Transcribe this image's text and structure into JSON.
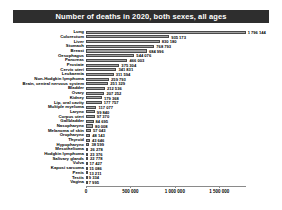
{
  "page": {
    "background": "#ffffff"
  },
  "header": {
    "title": "Number of deaths in 2020, both sexes, all ages",
    "bg_color": "#2e2e2e",
    "text_color": "#ffffff"
  },
  "chart_data": {
    "type": "bar",
    "orientation": "horizontal",
    "title": "Number of deaths in 2020, both sexes, all ages",
    "xlabel": "",
    "ylabel": "",
    "grid": false,
    "legend": "none",
    "xlim": [
      0,
      1800000
    ],
    "categories": [
      "Lung",
      "Colorectum",
      "Liver",
      "Stomach",
      "Breast",
      "Oesophagus",
      "Pancreas",
      "Prostate",
      "Cervix uteri",
      "Leukaemia",
      "Non-Hodgkin lymphoma",
      "Brain, central nervous system",
      "Bladder",
      "Ovary",
      "Kidney",
      "Lip, oral cavity",
      "Multiple myeloma",
      "Larynx",
      "Corpus uteri",
      "Gallbladder",
      "Nasopharynx",
      "Melanoma of skin",
      "Oropharynx",
      "Thyroid",
      "Hypopharynx",
      "Mesothelioma",
      "Hodgkin lymphoma",
      "Salivary glands",
      "Vulva",
      "Kaposi sarcoma",
      "Penis",
      "Testis",
      "Vagina"
    ],
    "values": [
      1796144,
      935173,
      830180,
      768793,
      684996,
      544076,
      466003,
      375304,
      341831,
      311594,
      259793,
      251329,
      212536,
      207252,
      179368,
      177757,
      117077,
      99840,
      97370,
      84695,
      80008,
      57043,
      48143,
      43646,
      38599,
      26278,
      23376,
      22778,
      17427,
      15086,
      13211,
      9334,
      7995
    ],
    "value_labels": [
      "1 796 144",
      "935 173",
      "830 180",
      "768 793",
      "684 996",
      "544 076",
      "466 003",
      "375 304",
      "341 831",
      "311 594",
      "259 793",
      "251 329",
      "212 536",
      "207 252",
      "179 368",
      "177 757",
      "117 077",
      "99 840",
      "97 370",
      "84 695",
      "80 008",
      "57 043",
      "48 143",
      "43 646",
      "38 599",
      "26 278",
      "23 376",
      "22 778",
      "17 427",
      "15 086",
      "13 211",
      "9 334",
      "7 995"
    ],
    "x_ticks": [
      {
        "value": 0,
        "label": "0"
      },
      {
        "value": 500000,
        "label": "500 000"
      },
      {
        "value": 1000000,
        "label": "1 000 000"
      },
      {
        "value": 1500000,
        "label": "1 500 000"
      }
    ],
    "bar_color": "#a2a2a2",
    "bar_border_color": "#4a4a4a"
  }
}
